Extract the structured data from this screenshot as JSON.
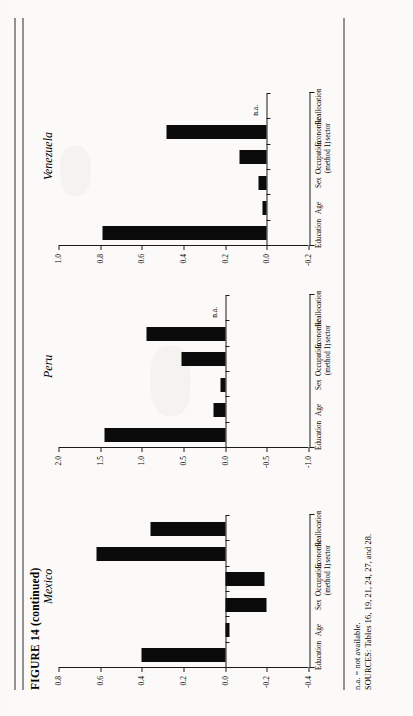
{
  "figure": {
    "title": "FIGURE 14",
    "title_suffix": "(continued)"
  },
  "notes": {
    "na_note": "n.a. = not available.",
    "sources": "SOURCES: Tables 16, 19, 21, 24, 27, and 28."
  },
  "categories": [
    "Education",
    "Age",
    "Sex",
    "Occupation\n(method 1)",
    "Economic\nsector",
    "Reallocation"
  ],
  "category_labels": [
    {
      "line1": "Education",
      "line2": ""
    },
    {
      "line1": "Age",
      "line2": ""
    },
    {
      "line1": "Sex",
      "line2": ""
    },
    {
      "line1": "Occupation",
      "line2": "(method 1)"
    },
    {
      "line1": "Economic",
      "line2": "sector"
    },
    {
      "line1": "Reallocation",
      "line2": ""
    }
  ],
  "na_marker": "n.a.",
  "chart_data": [
    {
      "type": "bar",
      "title": "Mexico",
      "xlabel": "",
      "ylabel": "",
      "categories": [
        "Education",
        "Age",
        "Sex",
        "Occupation (method 1)",
        "Economic sector",
        "Reallocation"
      ],
      "values": [
        0.4,
        -0.02,
        -0.2,
        -0.19,
        0.62,
        0.36
      ],
      "ylim": [
        -0.4,
        0.8
      ],
      "yticks": [
        0.8,
        0.6,
        0.4,
        0.2,
        0.0,
        -0.2,
        -0.4
      ],
      "ytick_labels": [
        "0.8",
        "0.6",
        "0.4",
        "0.2",
        "0.0",
        "-0.2",
        "-0.4"
      ],
      "grid": false,
      "legend": "none",
      "na_categories": []
    },
    {
      "type": "bar",
      "title": "Peru",
      "xlabel": "",
      "ylabel": "",
      "categories": [
        "Education",
        "Age",
        "Sex",
        "Occupation (method 1)",
        "Economic sector",
        "Reallocation"
      ],
      "values": [
        1.45,
        0.14,
        0.06,
        0.52,
        0.95,
        null
      ],
      "ylim": [
        -1.0,
        2.0
      ],
      "yticks": [
        2.0,
        1.5,
        1.0,
        0.5,
        0.0,
        -0.5,
        -1.0
      ],
      "ytick_labels": [
        "2.0",
        "1.5",
        "1.0",
        "0.5",
        "0.0",
        "-0.5",
        "-1.0"
      ],
      "grid": false,
      "legend": "none",
      "na_categories": [
        "Reallocation"
      ]
    },
    {
      "type": "bar",
      "title": "Venezuela",
      "xlabel": "",
      "ylabel": "",
      "categories": [
        "Education",
        "Age",
        "Sex",
        "Occupation (method 1)",
        "Economic sector",
        "Reallocation"
      ],
      "values": [
        0.79,
        0.02,
        0.04,
        0.13,
        0.48,
        null
      ],
      "ylim": [
        -0.2,
        1.0
      ],
      "yticks": [
        1.0,
        0.8,
        0.6,
        0.4,
        0.2,
        0.0,
        -0.2
      ],
      "ytick_labels": [
        "1.0",
        "0.8",
        "0.6",
        "0.4",
        "0.2",
        "0.0",
        "-0.2"
      ],
      "grid": false,
      "legend": "none",
      "na_categories": [
        "Reallocation"
      ]
    }
  ]
}
